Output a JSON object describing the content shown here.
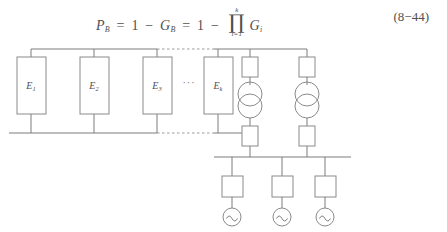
{
  "equation": {
    "lhs": "P",
    "lhs_sub": "B",
    "eq1": "=",
    "term1": "1",
    "minus1": "−",
    "g_b": "G",
    "g_b_sub": "B",
    "eq2": "=",
    "term2": "1",
    "minus2": "−",
    "product_symbol": "∏",
    "product_upper": "k",
    "product_lower": "i=1",
    "product_operand": "G",
    "product_operand_sub": "i",
    "full_text": "P_B = 1 - G_B = 1 - ∏(i=1..k) G_i",
    "number": "(8−44)"
  },
  "diagram": {
    "name": "power-system-reliability-one-line-diagram",
    "upper_bus": {
      "label": "upper-bus",
      "solid_left_x": 27,
      "dashed": true
    },
    "lower_bus": {
      "label": "lower-bus",
      "dashed": true
    },
    "element_blocks": [
      {
        "id": "E1",
        "label": "E",
        "subscript": "1"
      },
      {
        "id": "E2",
        "label": "E",
        "subscript": "2"
      },
      {
        "id": "E3",
        "label": "E",
        "subscript": "3"
      },
      {
        "id": "Ek",
        "label": "E",
        "subscript": "k"
      }
    ],
    "ellipsis": "···",
    "transformer_branches": [
      {
        "id": "transformer-branch-1",
        "upper_breaker": "breaker",
        "transformer": "two-winding-transformer",
        "lower_breaker": "breaker"
      },
      {
        "id": "transformer-branch-2",
        "upper_breaker": "breaker",
        "transformer": "two-winding-transformer",
        "lower_breaker": "breaker"
      }
    ],
    "generator_branches": [
      {
        "id": "generator-branch-1",
        "breaker": "breaker",
        "source": "ac-generator"
      },
      {
        "id": "generator-branch-2",
        "breaker": "breaker",
        "source": "ac-generator"
      },
      {
        "id": "generator-branch-3",
        "breaker": "breaker",
        "source": "ac-generator"
      }
    ],
    "generator_bus": {
      "label": "generator-bus"
    }
  },
  "colors": {
    "line": "#7d7d7d",
    "shape_stroke": "#8a8a8a",
    "text": "#4f4f4f",
    "dashed": "#9a9a9a",
    "background": "#ffffff"
  }
}
